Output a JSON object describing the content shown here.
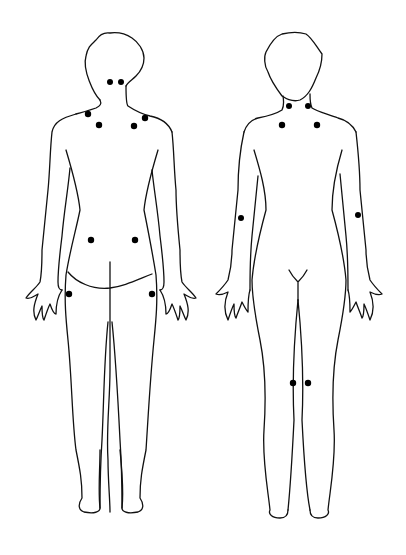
{
  "diagram": {
    "figures": [
      {
        "view": "back",
        "marked_points": 10
      },
      {
        "view": "front",
        "marked_points": 8
      }
    ],
    "marker_color": "#000000",
    "line_color": "#111111",
    "background": "#ffffff"
  }
}
